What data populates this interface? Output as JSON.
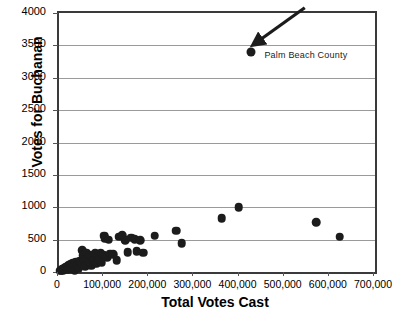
{
  "chart_data": {
    "type": "scatter",
    "title": "",
    "xlabel": "Total Votes Cast",
    "ylabel": "Votes for Buchanan",
    "xlim": [
      0,
      700000
    ],
    "ylim": [
      0,
      4000
    ],
    "grid": true,
    "legend": null,
    "xticks": [
      0,
      100000,
      200000,
      300000,
      400000,
      500000,
      600000,
      700000
    ],
    "xtick_labels": [
      "0",
      "100,000",
      "200,000",
      "300,000",
      "400,000",
      "500,000",
      "600,000",
      "700,000"
    ],
    "yticks": [
      0,
      500,
      1000,
      1500,
      2000,
      2500,
      3000,
      3500,
      4000
    ],
    "ytick_labels": [
      "0",
      "500",
      "1000",
      "1500",
      "2000",
      "2500",
      "3000",
      "3500",
      "4000"
    ],
    "marker_color": "#1c1c1c",
    "grid_color": "#9a9a9a",
    "axis_color": "#3a3a3a",
    "annotations": [
      {
        "text": "Palm Beach County",
        "point_x": 425000,
        "point_y": 3400,
        "label_x": 455000,
        "label_y": 3330,
        "arrow_from_x": 545000,
        "arrow_from_y": 4080,
        "arrow_to_x": 437000,
        "arrow_to_y": 3540
      }
    ],
    "points": [
      {
        "x": 3000,
        "y": 20
      },
      {
        "x": 5000,
        "y": 30
      },
      {
        "x": 7000,
        "y": 45
      },
      {
        "x": 9000,
        "y": 25
      },
      {
        "x": 11000,
        "y": 55
      },
      {
        "x": 13000,
        "y": 35
      },
      {
        "x": 15000,
        "y": 70
      },
      {
        "x": 17000,
        "y": 50
      },
      {
        "x": 19000,
        "y": 90
      },
      {
        "x": 21000,
        "y": 40
      },
      {
        "x": 23000,
        "y": 110
      },
      {
        "x": 25000,
        "y": 75
      },
      {
        "x": 27000,
        "y": 130
      },
      {
        "x": 29000,
        "y": 60
      },
      {
        "x": 31000,
        "y": 145
      },
      {
        "x": 33000,
        "y": 95
      },
      {
        "x": 35000,
        "y": 30
      },
      {
        "x": 38000,
        "y": 160
      },
      {
        "x": 41000,
        "y": 105
      },
      {
        "x": 44000,
        "y": 55
      },
      {
        "x": 47000,
        "y": 175
      },
      {
        "x": 50000,
        "y": 120
      },
      {
        "x": 52000,
        "y": 340
      },
      {
        "x": 54000,
        "y": 260
      },
      {
        "x": 56000,
        "y": 195
      },
      {
        "x": 58000,
        "y": 85
      },
      {
        "x": 60000,
        "y": 300
      },
      {
        "x": 63000,
        "y": 215
      },
      {
        "x": 66000,
        "y": 150
      },
      {
        "x": 68000,
        "y": 270
      },
      {
        "x": 71000,
        "y": 100
      },
      {
        "x": 74000,
        "y": 235
      },
      {
        "x": 77000,
        "y": 180
      },
      {
        "x": 80000,
        "y": 290
      },
      {
        "x": 83000,
        "y": 130
      },
      {
        "x": 86000,
        "y": 250
      },
      {
        "x": 89000,
        "y": 195
      },
      {
        "x": 92000,
        "y": 300
      },
      {
        "x": 95000,
        "y": 145
      },
      {
        "x": 98000,
        "y": 270
      },
      {
        "x": 100000,
        "y": 560
      },
      {
        "x": 103000,
        "y": 515
      },
      {
        "x": 107000,
        "y": 230
      },
      {
        "x": 110000,
        "y": 500
      },
      {
        "x": 114000,
        "y": 285
      },
      {
        "x": 120000,
        "y": 275
      },
      {
        "x": 128000,
        "y": 180
      },
      {
        "x": 134000,
        "y": 545
      },
      {
        "x": 140000,
        "y": 570
      },
      {
        "x": 146000,
        "y": 490
      },
      {
        "x": 152000,
        "y": 310
      },
      {
        "x": 160000,
        "y": 530
      },
      {
        "x": 168000,
        "y": 505
      },
      {
        "x": 172000,
        "y": 320
      },
      {
        "x": 180000,
        "y": 490
      },
      {
        "x": 186000,
        "y": 300
      },
      {
        "x": 212000,
        "y": 560
      },
      {
        "x": 260000,
        "y": 635
      },
      {
        "x": 272000,
        "y": 445
      },
      {
        "x": 360000,
        "y": 830
      },
      {
        "x": 398000,
        "y": 1000
      },
      {
        "x": 425000,
        "y": 3400
      },
      {
        "x": 570000,
        "y": 770
      },
      {
        "x": 622000,
        "y": 545
      }
    ]
  }
}
